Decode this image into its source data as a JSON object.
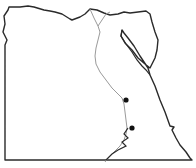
{
  "map": {
    "title": "Egypt outline map",
    "colors": {
      "background": "#ffffff",
      "border": "#2a2a2a",
      "river": "#9a9a9a",
      "marker": "#111111"
    },
    "markers": [
      {
        "name": "site-1",
        "x": 126,
        "y": 100
      },
      {
        "name": "site-2",
        "x": 132,
        "y": 128
      }
    ]
  }
}
